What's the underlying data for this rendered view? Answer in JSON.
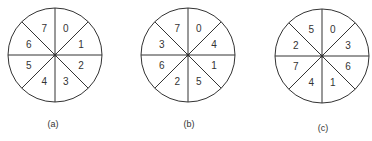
{
  "diagrams": [
    {
      "caption": "(a)",
      "center": [
        55,
        55
      ],
      "radius": 47,
      "caption_pos": [
        53,
        124
      ],
      "sectors_clockwise_from_top_right": [
        "0",
        "1",
        "2",
        "3",
        "4",
        "5",
        "6",
        "7"
      ]
    },
    {
      "caption": "(b)",
      "center": [
        188,
        55
      ],
      "radius": 47,
      "caption_pos": [
        189,
        124
      ],
      "sectors_clockwise_from_top_right": [
        "0",
        "4",
        "1",
        "5",
        "2",
        "6",
        "3",
        "7"
      ]
    },
    {
      "caption": "(c)",
      "center": [
        322,
        56
      ],
      "radius": 47,
      "caption_pos": [
        323,
        128
      ],
      "sectors_clockwise_from_top_right": [
        "0",
        "3",
        "6",
        "1",
        "4",
        "7",
        "2",
        "5"
      ]
    }
  ],
  "colors": {
    "line": "#333333",
    "background": "#ffffff"
  }
}
